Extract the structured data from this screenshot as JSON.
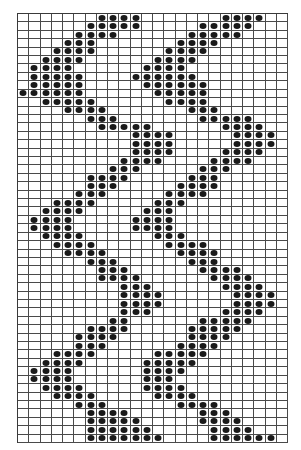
{
  "diagram": {
    "type": "knitting-chart",
    "columns": 24,
    "rows": 51,
    "filled_color": "#1a1a1a",
    "line_color": "#4a4a4a",
    "background": "#ffffff",
    "filled_cells_by_row": [
      [
        7,
        8,
        9,
        10,
        18,
        19,
        20,
        21
      ],
      [
        6,
        7,
        8,
        9,
        10,
        16,
        17,
        18,
        19,
        20
      ],
      [
        5,
        6,
        7,
        8,
        15,
        16,
        17,
        18,
        19
      ],
      [
        4,
        5,
        6,
        14,
        15,
        16,
        17
      ],
      [
        3,
        4,
        5,
        6,
        13,
        14,
        15,
        16
      ],
      [
        2,
        3,
        4,
        5,
        12,
        13,
        14,
        15
      ],
      [
        1,
        2,
        3,
        4,
        11,
        12,
        13,
        14
      ],
      [
        1,
        2,
        3,
        4,
        5,
        10,
        11,
        12,
        13,
        14,
        15
      ],
      [
        1,
        2,
        3,
        4,
        5,
        11,
        12,
        13,
        14,
        15,
        16
      ],
      [
        0,
        1,
        2,
        3,
        4,
        5,
        12,
        13,
        14,
        15,
        16
      ],
      [
        2,
        3,
        4,
        5,
        6,
        13,
        14,
        15,
        16
      ],
      [
        4,
        5,
        6,
        7,
        15,
        16,
        17
      ],
      [
        6,
        7,
        8,
        16,
        17,
        18,
        19,
        20
      ],
      [
        7,
        8,
        9,
        10,
        11,
        18,
        19,
        20,
        21
      ],
      [
        10,
        11,
        12,
        13,
        19,
        20,
        21,
        22
      ],
      [
        10,
        11,
        12,
        13,
        19,
        20,
        21,
        22
      ],
      [
        10,
        11,
        12,
        13,
        18,
        19,
        20,
        21
      ],
      [
        9,
        10,
        11,
        12,
        17,
        18,
        19,
        20
      ],
      [
        8,
        9,
        10,
        16,
        17,
        18
      ],
      [
        6,
        7,
        8,
        9,
        15,
        16,
        17
      ],
      [
        6,
        7,
        8,
        14,
        15,
        16,
        17
      ],
      [
        5,
        6,
        7,
        13,
        14,
        15,
        16
      ],
      [
        3,
        4,
        5,
        6,
        12,
        13,
        14
      ],
      [
        2,
        3,
        4,
        5,
        11,
        12,
        13
      ],
      [
        1,
        2,
        3,
        4,
        10,
        11,
        12,
        13
      ],
      [
        1,
        2,
        3,
        4,
        10,
        11,
        12,
        13
      ],
      [
        2,
        3,
        4,
        5,
        12,
        13,
        14
      ],
      [
        3,
        4,
        5,
        6,
        13,
        14,
        15,
        16
      ],
      [
        4,
        5,
        6,
        7,
        14,
        15,
        16,
        17
      ],
      [
        6,
        7,
        8,
        15,
        16,
        17
      ],
      [
        7,
        8,
        9,
        16,
        17,
        18,
        19
      ],
      [
        7,
        8,
        9,
        10,
        17,
        18,
        19,
        20
      ],
      [
        9,
        10,
        11,
        18,
        19,
        20,
        21
      ],
      [
        9,
        10,
        11,
        12,
        19,
        20,
        21,
        22
      ],
      [
        9,
        10,
        11,
        12,
        19,
        20,
        21,
        22
      ],
      [
        9,
        10,
        11,
        18,
        19,
        20,
        21
      ],
      [
        8,
        9,
        16,
        17,
        18,
        19,
        20
      ],
      [
        6,
        7,
        8,
        9,
        15,
        16,
        17,
        18,
        19
      ],
      [
        5,
        6,
        7,
        8,
        15,
        16,
        17,
        18
      ],
      [
        5,
        6,
        7,
        14,
        15,
        16,
        17
      ],
      [
        3,
        4,
        5,
        6,
        12,
        13,
        14,
        15,
        16
      ],
      [
        2,
        3,
        4,
        5,
        11,
        12,
        13,
        14,
        15
      ],
      [
        1,
        2,
        3,
        4,
        11,
        12,
        13,
        14
      ],
      [
        1,
        2,
        3,
        4,
        11,
        12,
        13
      ],
      [
        2,
        3,
        4,
        5,
        11,
        12,
        13,
        14
      ],
      [
        3,
        4,
        5,
        6,
        12,
        13,
        14,
        15
      ],
      [
        5,
        6,
        7,
        14,
        15,
        16,
        17
      ],
      [
        6,
        7,
        8,
        9,
        16,
        17,
        18
      ],
      [
        6,
        7,
        8,
        9,
        10,
        16,
        17,
        18,
        19
      ],
      [
        6,
        7,
        8,
        9,
        10,
        11,
        17,
        18,
        19,
        20
      ],
      [
        6,
        7,
        8,
        9,
        10,
        11,
        12,
        17,
        18,
        19,
        20,
        21,
        22
      ]
    ]
  }
}
